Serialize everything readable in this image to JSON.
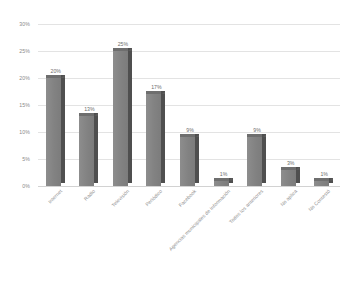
{
  "chart_data": {
    "type": "bar",
    "title": "",
    "subtitle": "",
    "xlabel": "",
    "ylabel": "",
    "categories": [
      "Internet",
      "Radio",
      "Televisión",
      "Periódico",
      "Facebook",
      "Agencias municipales de información",
      "Todos los anteriores",
      "No aplica",
      "No Contestó"
    ],
    "values": [
      20,
      13,
      25,
      17,
      9,
      1,
      9,
      3,
      1
    ],
    "value_labels": [
      "20%",
      "13%",
      "25%",
      "17%",
      "9%",
      "1%",
      "9%",
      "3%",
      "1%"
    ],
    "ylim": [
      0,
      30
    ],
    "ytick_values": [
      30,
      25,
      20,
      15,
      10,
      5,
      0
    ],
    "ytick_labels": [
      "30%",
      "25%",
      "20%",
      "15%",
      "10%",
      "5%",
      "0%"
    ],
    "grid": true,
    "legend": false,
    "legend_position": "none",
    "style": "3d-column",
    "bar_color": "#878787",
    "bar_side_color": "#4f4f4f",
    "grid_color": "#e3e3e3",
    "background_color": "#ffffff",
    "text_color": "#8a8a8a"
  }
}
